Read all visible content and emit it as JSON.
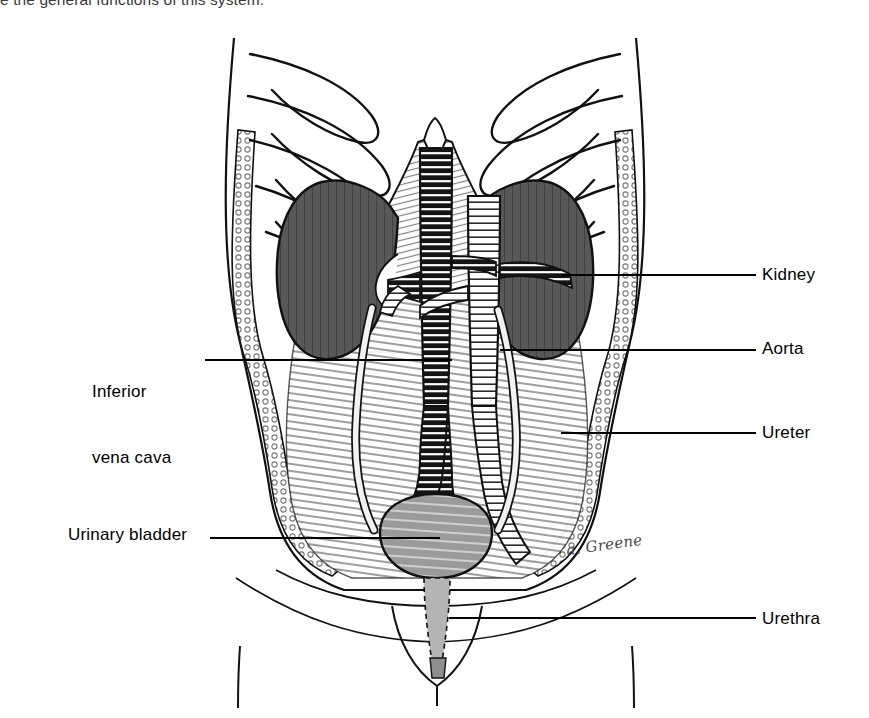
{
  "page": {
    "background_color": "#ffffff",
    "width": 869,
    "height": 718,
    "clipped_body_text": "e the general functions of this system."
  },
  "figure": {
    "artist_signature": "a. Greene",
    "ink_color": "#111111",
    "organ_fill_kidney": "#58585a",
    "organ_fill_bladder": "#8d8d8f",
    "tissue_fill": "#d8d8d8",
    "paper_fill": "#ffffff"
  },
  "labels": {
    "kidney": "Kidney",
    "aorta": "Aorta",
    "ureter": "Ureter",
    "urethra": "Urethra",
    "inferior_vena_cava_line1": "Inferior",
    "inferior_vena_cava_line2": "vena cava",
    "urinary_bladder": "Urinary bladder"
  },
  "leader_lines": [
    {
      "name": "kidney",
      "x1": 562,
      "y1": 275,
      "x2": 756,
      "y2": 275
    },
    {
      "name": "aorta",
      "x1": 500,
      "y1": 350,
      "x2": 756,
      "y2": 350
    },
    {
      "name": "ureter",
      "x1": 561,
      "y1": 433,
      "x2": 756,
      "y2": 433
    },
    {
      "name": "urethra",
      "x1": 449,
      "y1": 618,
      "x2": 756,
      "y2": 618
    },
    {
      "name": "inferior-vena-cava",
      "x1": 205,
      "y1": 360,
      "x2": 452,
      "y2": 360
    },
    {
      "name": "urinary-bladder",
      "x1": 210,
      "y1": 538,
      "x2": 440,
      "y2": 538
    }
  ],
  "anatomy_parts": [
    "rib-cage",
    "diaphragm",
    "left-kidney",
    "right-kidney",
    "abdominal-aorta",
    "inferior-vena-cava",
    "renal-arteries",
    "renal-veins",
    "common-iliac-vessels",
    "left-ureter",
    "right-ureter",
    "urinary-bladder",
    "urethra",
    "abdominal-wall",
    "torso-outline",
    "thigh-outline"
  ]
}
